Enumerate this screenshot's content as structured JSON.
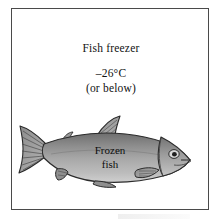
{
  "figure": {
    "caption_title": "Fish freezer",
    "temperature": "–26°C",
    "temperature_qualifier": "(or below)",
    "fish_label_line1": "Frozen",
    "fish_label_line2": "fish",
    "icons": {
      "fish": "fish-icon",
      "tail": "fish-tail-icon",
      "eye": "fish-eye-icon",
      "dorsal_fin": "dorsal-fin-icon",
      "adipose_fin": "adipose-fin-icon",
      "pectoral_fin": "pectoral-fin-icon",
      "pelvic_fin": "pelvic-fin-icon",
      "anal_fin": "anal-fin-icon"
    }
  },
  "colors": {
    "frame_border": "#4a4a4a",
    "background": "#ffffff",
    "text": "#111111",
    "fish_body": "#a3a3a3",
    "fish_back": "#6e6e6e",
    "fish_belly": "#cfcfcf",
    "fish_fin": "#8f8f8f",
    "fish_outline": "#2b2b2b",
    "fish_head": "#9a9a9a"
  }
}
